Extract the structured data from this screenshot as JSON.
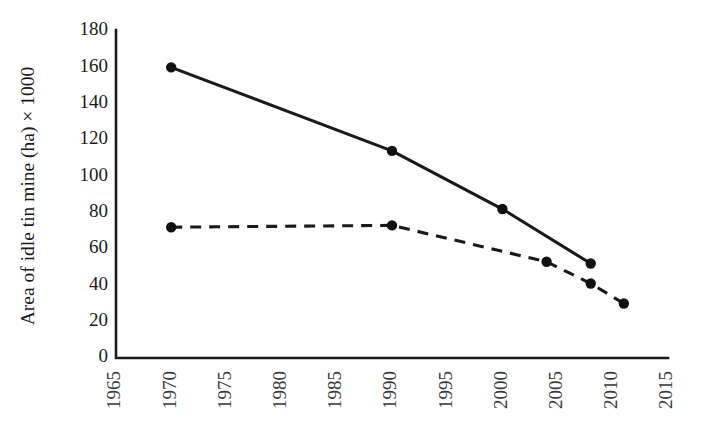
{
  "chart_data": {
    "type": "line",
    "title": "",
    "xlabel": "",
    "ylabel": "Area of idle tin mine (ha) × 1000",
    "xlim": [
      1965,
      2015
    ],
    "ylim": [
      0,
      180
    ],
    "xticks": [
      1965,
      1970,
      1975,
      1980,
      1985,
      1990,
      1995,
      2000,
      2005,
      2010,
      2015
    ],
    "xtick_labels": [
      "1965",
      "1970",
      "1975",
      "1980",
      "1985",
      "1990",
      "1995",
      "2000",
      "2005",
      "2010",
      "2015"
    ],
    "yticks": [
      0,
      20,
      40,
      60,
      80,
      100,
      120,
      140,
      160,
      180
    ],
    "ytick_labels": [
      "0",
      "20",
      "40",
      "60",
      "80",
      "100",
      "120",
      "140",
      "160",
      "180"
    ],
    "grid": false,
    "legend": "none",
    "xtick_rotation": 90,
    "series": [
      {
        "name": "solid-series",
        "style": "solid",
        "color": "#1a1a1a",
        "marker": "circle",
        "x": [
          1970,
          1990,
          2000,
          2008
        ],
        "values": [
          160,
          114,
          82,
          52
        ]
      },
      {
        "name": "dashed-series",
        "style": "dashed",
        "color": "#1a1a1a",
        "marker": "circle",
        "x": [
          1970,
          1990,
          2004,
          2008,
          2011
        ],
        "values": [
          72,
          73,
          53,
          41,
          30
        ]
      }
    ]
  }
}
